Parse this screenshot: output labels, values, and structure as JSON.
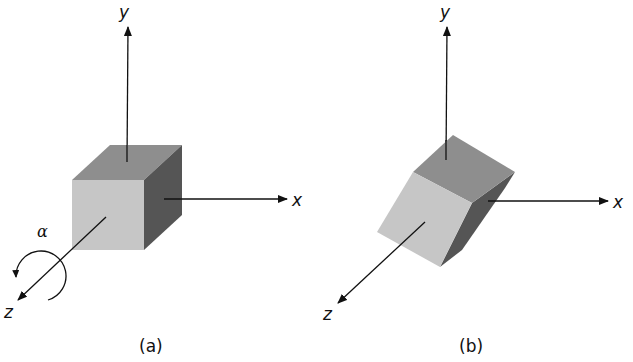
{
  "figure": {
    "panels": [
      {
        "id": "a",
        "caption": "(a)",
        "axes": {
          "x": "x",
          "y": "y",
          "z": "z"
        },
        "rotation_label": "α",
        "object": "cube"
      },
      {
        "id": "b",
        "caption": "(b)",
        "axes": {
          "x": "x",
          "y": "y",
          "z": "z"
        },
        "object": "cube rotated about z-axis"
      }
    ],
    "colors": {
      "top_face": "#8e8e8e",
      "front_face": "#c6c6c6",
      "side_face": "#555555",
      "axis": "#111111"
    }
  }
}
